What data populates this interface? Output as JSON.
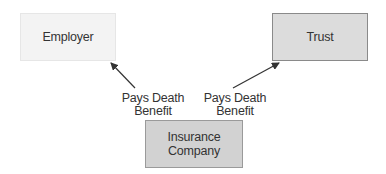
{
  "diagram": {
    "type": "flow",
    "nodes": [
      {
        "id": "employer",
        "label": "Employer",
        "fill": "#f3f3f3"
      },
      {
        "id": "trust",
        "label": "Trust",
        "fill": "#dcdcdc"
      },
      {
        "id": "insurer",
        "label_line1": "Insurance",
        "label_line2": "Company",
        "fill": "#d2d2d2"
      }
    ],
    "edges": [
      {
        "from": "insurer",
        "to": "employer",
        "label_line1": "Pays Death",
        "label_line2": "Benefit"
      },
      {
        "from": "insurer",
        "to": "trust",
        "label_line1": "Pays Death",
        "label_line2": "Benefit"
      }
    ],
    "arrow_color": "#333333"
  }
}
